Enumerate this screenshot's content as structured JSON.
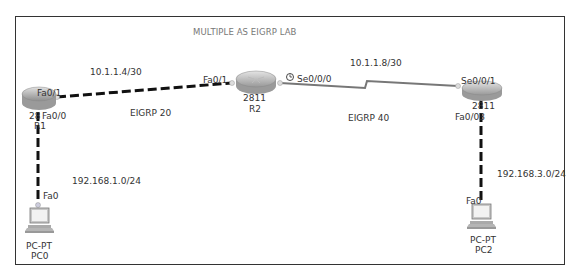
{
  "diagram": {
    "title": "MULTIPLE AS EIGRP LAB",
    "colors": {
      "frame": "#333333",
      "ethernet_link": "#111111",
      "serial_link": "#777777",
      "label_text": "#333333",
      "title_text": "#777777",
      "router_body": "#b8b8b8"
    },
    "devices": [
      {
        "id": "R1",
        "model": "28",
        "type": "router",
        "name": "R1"
      },
      {
        "id": "R2",
        "model": "2811",
        "type": "router",
        "name": "R2"
      },
      {
        "id": "R3",
        "model": "2811",
        "type": "router",
        "name": ""
      },
      {
        "id": "PC0",
        "model": "PC-PT",
        "type": "pc",
        "name": "PC0"
      },
      {
        "id": "PC2",
        "model": "PC-PT",
        "type": "pc",
        "name": "PC2"
      }
    ],
    "interfaces": {
      "r1_fa01": "Fa0/1",
      "r1_fa00": "Fa0/0",
      "r2_fa01": "Fa0/1",
      "r2_se000": "Se0/0/0",
      "r3_se001": "Se0/0/1",
      "r3_fa00": "Fa0/03",
      "pc0_fa0": "Fa0",
      "pc2_fa0": "Fa0"
    },
    "networks": {
      "r1_r2": "10.1.1.4/30",
      "r2_r3": "10.1.1.8/30",
      "lan1": "192.168.1.0/24",
      "lan3": "192.168.3.0/24"
    },
    "as_labels": {
      "as20": "EIGRP 20",
      "as40": "EIGRP 40"
    },
    "links": [
      {
        "from": "R1 Fa0/1",
        "to": "R2 Fa0/1",
        "type": "ethernet-copper",
        "network": "10.1.1.4/30"
      },
      {
        "from": "R2 Se0/0/0",
        "to": "R3 Se0/0/1",
        "type": "serial-dce",
        "network": "10.1.1.8/30"
      },
      {
        "from": "R1 Fa0/0",
        "to": "PC0 Fa0",
        "type": "ethernet-copper",
        "network": "192.168.1.0/24"
      },
      {
        "from": "R3 Fa0/0",
        "to": "PC2 Fa0",
        "type": "ethernet-copper",
        "network": "192.168.3.0/24"
      }
    ]
  }
}
